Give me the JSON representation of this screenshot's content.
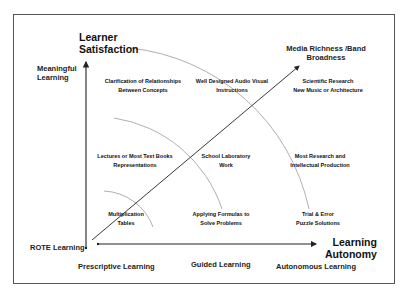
{
  "axes": {
    "y_title": [
      "Learner",
      "Satisfaction"
    ],
    "x_title": [
      "Learning",
      "Autonomy"
    ],
    "diagonal_title": [
      "Media Richness /Band",
      "Broadness"
    ],
    "y_levels": {
      "top": [
        "Meaningful",
        "Learning"
      ],
      "bottom": "ROTE Learning"
    },
    "x_levels": [
      "Prescriptive Learning",
      "Guided Learning",
      "Autonomous Learning"
    ]
  },
  "cells": {
    "top_left": [
      "Clarification of Relationships",
      "Between Concepts"
    ],
    "top_mid": [
      "Well Designed Audio Visual",
      "Instructions"
    ],
    "top_right": [
      "Scientific Research",
      "New Music  or  Architecture"
    ],
    "mid_left": [
      "Lectures or Most Text Books",
      "Representations"
    ],
    "mid_mid": [
      "School Laboratory",
      "Work"
    ],
    "mid_right": [
      "Most Research and",
      "Intellectual Production"
    ],
    "bot_left": [
      "Multiplication",
      "Tables"
    ],
    "bot_mid": [
      "Applying Formulas to",
      "Solve Problems"
    ],
    "bot_right": [
      "Trial & Error",
      "Puzzle Solutions"
    ]
  },
  "colors": {
    "line": "#222222",
    "arc": "#9a9a9a",
    "frame": "#555555"
  }
}
